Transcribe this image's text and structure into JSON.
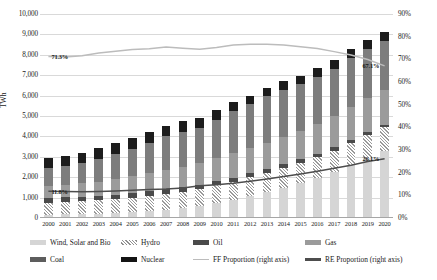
{
  "chart_data": {
    "type": "bar",
    "title": "",
    "xlabel": "",
    "ylabel": "TWh",
    "ylim": [
      0,
      10000
    ],
    "y2lim": [
      0,
      90
    ],
    "ylabel_right": "",
    "grid": true,
    "legend_position": "bottom",
    "categories": [
      "2000",
      "2001",
      "2002",
      "2003",
      "2004",
      "2005",
      "2006",
      "2007",
      "2008",
      "2009",
      "2010",
      "2011",
      "2012",
      "2013",
      "2014",
      "2015",
      "2016",
      "2017",
      "2018",
      "2019",
      "2020"
    ],
    "yticks": [
      "0",
      "1,000",
      "2,000",
      "3,000",
      "4,000",
      "5,000",
      "6,000",
      "7,000",
      "8,000",
      "9,000",
      "10,000"
    ],
    "yticks_right": [
      "0%",
      "10%",
      "20%",
      "30%",
      "40%",
      "50%",
      "60%",
      "70%",
      "80%",
      "90%"
    ],
    "series": [
      {
        "name": "Wind, Solar and Bio",
        "type": "bar",
        "stack": "gen",
        "values": [
          160,
          175,
          195,
          220,
          250,
          290,
          340,
          410,
          500,
          600,
          730,
          900,
          1080,
          1270,
          1480,
          1700,
          1960,
          2250,
          2600,
          2950,
          3300
        ]
      },
      {
        "name": "Hydro",
        "type": "bar",
        "stack": "gen",
        "values": [
          600,
          610,
          620,
          640,
          670,
          700,
          740,
          770,
          800,
          830,
          870,
          890,
          930,
          960,
          990,
          1010,
          1040,
          1060,
          1090,
          1110,
          1140
        ]
      },
      {
        "name": "Oil",
        "type": "bar",
        "stack": "gen",
        "values": [
          230,
          230,
          230,
          230,
          230,
          230,
          225,
          220,
          215,
          205,
          200,
          195,
          185,
          175,
          165,
          160,
          155,
          150,
          145,
          140,
          130
        ]
      },
      {
        "name": "Gas",
        "type": "bar",
        "stack": "gen",
        "values": [
          560,
          600,
          650,
          700,
          760,
          820,
          880,
          960,
          1010,
          1040,
          1130,
          1190,
          1250,
          1280,
          1320,
          1390,
          1470,
          1530,
          1600,
          1680,
          1700
        ]
      },
      {
        "name": "Coal",
        "type": "bar",
        "stack": "gen",
        "values": [
          900,
          930,
          1000,
          1120,
          1230,
          1360,
          1500,
          1640,
          1700,
          1720,
          1880,
          2060,
          2160,
          2280,
          2330,
          2300,
          2290,
          2340,
          2420,
          2400,
          2390
        ]
      },
      {
        "name": "Nuclear",
        "type": "bar",
        "stack": "gen",
        "values": [
          480,
          490,
          500,
          500,
          520,
          520,
          520,
          520,
          510,
          490,
          500,
          440,
          400,
          400,
          410,
          420,
          430,
          440,
          450,
          470,
          460
        ]
      },
      {
        "name": "FF Proportion (right axis)",
        "type": "line",
        "axis": "right",
        "values": [
          71.3,
          71.0,
          71.6,
          72.8,
          73.6,
          74.3,
          74.7,
          75.4,
          74.9,
          74.5,
          75.2,
          76.3,
          76.6,
          76.6,
          76.3,
          75.6,
          74.8,
          73.4,
          71.9,
          69.9,
          67.1
        ]
      },
      {
        "name": "RE Proportion (right axis)",
        "type": "line",
        "axis": "right",
        "values": [
          11.8,
          11.7,
          11.6,
          11.7,
          11.9,
          12.2,
          12.6,
          12.8,
          13.2,
          14.2,
          14.7,
          15.3,
          16.2,
          17.2,
          18.3,
          19.4,
          20.6,
          21.9,
          23.3,
          24.9,
          26.1
        ]
      }
    ],
    "annotations": [
      {
        "text": "71.3%",
        "series": "FF Proportion (right axis)",
        "at": "2000"
      },
      {
        "text": "67.1%",
        "series": "FF Proportion (right axis)",
        "at": "2020"
      },
      {
        "text": "11.8%",
        "series": "RE Proportion (right axis)",
        "at": "2000"
      },
      {
        "text": "26.1%",
        "series": "RE Proportion (right axis)",
        "at": "2020"
      }
    ]
  },
  "legend": {
    "row1": [
      {
        "label": "Wind, Solar and Bio",
        "swatch": "wsb"
      },
      {
        "label": "Hydro",
        "swatch": "hydro"
      },
      {
        "label": "Oil",
        "swatch": "oil"
      },
      {
        "label": "Gas",
        "swatch": "gas"
      }
    ],
    "row2": [
      {
        "label": "Coal",
        "swatch": "coal"
      },
      {
        "label": "Nuclear",
        "swatch": "nuclear"
      },
      {
        "label": "FF Proportion (right axis)",
        "swatch": "ff"
      },
      {
        "label": "RE Proportion (right axis)",
        "swatch": "re"
      }
    ]
  },
  "colors": {
    "wind_solar_bio": "#d5d5d5",
    "hydro": "#9a9a9a",
    "oil": "#4a4a4a",
    "gas": "#9b9b9b",
    "coal": "#7d7d7d",
    "nuclear": "#1c1c1c",
    "ff_line": "#bcbcbc",
    "re_line": "#4d4d4d",
    "grid": "#d9d9d9"
  }
}
